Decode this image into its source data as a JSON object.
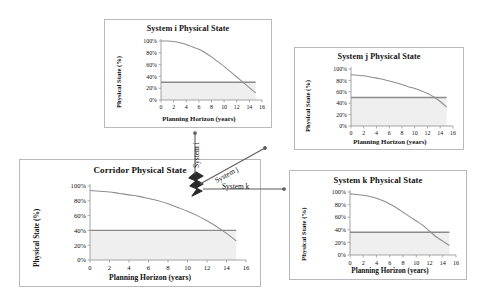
{
  "figure": {
    "colors": {
      "curve": "#8d8d8d",
      "threshold": "#8a8a8a",
      "shaded_region": "#efefef",
      "axis": "#9a9a9a",
      "panel_border": "#b9b9b9",
      "text": "#111111",
      "connector": "#6f6f6f"
    }
  },
  "connectors": [
    {
      "id": "system-i",
      "label": "System i",
      "orientation": "vertical-up",
      "label_rotation": -90
    },
    {
      "id": "system-j",
      "label": "System j",
      "orientation": "diagonal-up-right",
      "label_rotation": -30
    },
    {
      "id": "system-k",
      "label": "System k",
      "orientation": "horizontal-right",
      "label_rotation": 0
    }
  ],
  "chart_data": [
    {
      "id": "system-i",
      "type": "line",
      "title": "System i Physical State",
      "xlabel": "Planning Horizon (years)",
      "ylabel": "Physical State (%)",
      "xlim": [
        0,
        16
      ],
      "ylim": [
        0,
        100
      ],
      "xticks": [
        "0",
        "2",
        "4",
        "6",
        "8",
        "10",
        "12",
        "14",
        "16"
      ],
      "yticks": [
        "0%",
        "20%",
        "40%",
        "60%",
        "80%",
        "100%"
      ],
      "grid": false,
      "legend": "none",
      "threshold": 30,
      "threshold_label": "minimum acceptable physical state",
      "shaded_below_threshold": true,
      "series": [
        {
          "name": "Physical State",
          "x": [
            0,
            1,
            2,
            3,
            4,
            5,
            6,
            7,
            8,
            9,
            10,
            11,
            12,
            13,
            14,
            15
          ],
          "values": [
            100,
            100,
            99,
            97,
            94,
            90,
            86,
            80,
            73,
            65,
            57,
            48,
            39,
            30,
            21,
            12
          ]
        }
      ]
    },
    {
      "id": "system-j",
      "type": "line",
      "title": "System j Physical State",
      "xlabel": "Planning Horizon (years)",
      "ylabel": "Physical State (%)",
      "xlim": [
        0,
        16
      ],
      "ylim": [
        0,
        100
      ],
      "xticks": [
        "0",
        "2",
        "4",
        "6",
        "8",
        "10",
        "12",
        "14",
        "16"
      ],
      "yticks": [
        "0%",
        "20%",
        "40%",
        "60%",
        "80%",
        "100%"
      ],
      "grid": false,
      "legend": "none",
      "threshold": 50,
      "threshold_label": "minimum acceptable physical state",
      "shaded_below_threshold": true,
      "series": [
        {
          "name": "Physical State",
          "x": [
            0,
            1,
            2,
            3,
            4,
            5,
            6,
            7,
            8,
            9,
            10,
            11,
            12,
            13,
            14,
            15
          ],
          "values": [
            90,
            89,
            88,
            86,
            84,
            82,
            79,
            76,
            73,
            69,
            66,
            62,
            57,
            51,
            43,
            33
          ]
        }
      ]
    },
    {
      "id": "corridor",
      "type": "line",
      "title": "Corridor Physical State",
      "xlabel": "Planning Horizon (years)",
      "ylabel": "Physical State (%)",
      "xlim": [
        0,
        16
      ],
      "ylim": [
        0,
        100
      ],
      "xticks": [
        "0",
        "2",
        "4",
        "6",
        "8",
        "10",
        "12",
        "14",
        "16"
      ],
      "yticks": [
        "0%",
        "20%",
        "40%",
        "60%",
        "80%",
        "100%"
      ],
      "grid": false,
      "legend": "none",
      "threshold": 40,
      "threshold_label": "minimum acceptable physical state",
      "shaded_below_threshold": true,
      "series": [
        {
          "name": "Physical State",
          "x": [
            0,
            1,
            2,
            3,
            4,
            5,
            6,
            7,
            8,
            9,
            10,
            11,
            12,
            13,
            14,
            15
          ],
          "values": [
            94,
            93,
            92,
            90,
            88,
            86,
            83,
            80,
            76,
            71,
            66,
            60,
            53,
            45,
            36,
            26
          ]
        }
      ]
    },
    {
      "id": "system-k",
      "type": "line",
      "title": "System k Physical State",
      "xlabel": "Planning Horizon (years)",
      "ylabel": "Physical State (%)",
      "xlim": [
        0,
        16
      ],
      "ylim": [
        0,
        100
      ],
      "xticks": [
        "0",
        "2",
        "4",
        "6",
        "8",
        "10",
        "12",
        "14",
        "16"
      ],
      "yticks": [
        "0%",
        "20%",
        "40%",
        "60%",
        "80%",
        "100%"
      ],
      "grid": false,
      "legend": "none",
      "threshold": 36,
      "threshold_label": "minimum acceptable physical state",
      "shaded_below_threshold": true,
      "series": [
        {
          "name": "Physical State",
          "x": [
            0,
            1,
            2,
            3,
            4,
            5,
            6,
            7,
            8,
            9,
            10,
            11,
            12,
            13,
            14,
            15
          ],
          "values": [
            97,
            96,
            95,
            93,
            90,
            86,
            81,
            75,
            68,
            61,
            54,
            47,
            38,
            29,
            22,
            15
          ]
        }
      ]
    }
  ]
}
